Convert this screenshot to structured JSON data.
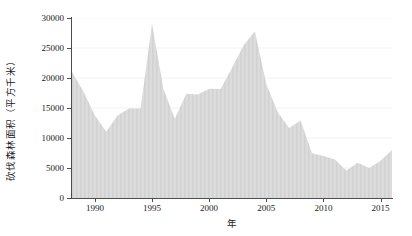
{
  "chart_data": {
    "type": "area",
    "title": "",
    "xlabel": "年",
    "ylabel": "砍伐森林面积（平方千米）",
    "xlim": [
      1988,
      2016
    ],
    "ylim": [
      0,
      30000
    ],
    "grid": true,
    "legend": null,
    "yticks": [
      0,
      5000,
      10000,
      15000,
      20000,
      25000,
      30000
    ],
    "ytick_labels": [
      "0",
      "5000",
      "10000",
      "15000",
      "20000",
      "25000",
      "30000"
    ],
    "xticks": [
      1990,
      1995,
      2000,
      2005,
      2010,
      2015
    ],
    "xtick_labels": [
      "1990",
      "1995",
      "2000",
      "2005",
      "2010",
      "2015"
    ],
    "x": [
      1988,
      1989,
      1990,
      1991,
      1992,
      1993,
      1994,
      1995,
      1996,
      1997,
      1998,
      1999,
      2000,
      2001,
      2002,
      2003,
      2004,
      2005,
      2006,
      2007,
      2008,
      2009,
      2010,
      2011,
      2012,
      2013,
      2014,
      2015,
      2016
    ],
    "values": [
      21050,
      17770,
      13730,
      11030,
      13786,
      14896,
      14896,
      29059,
      18161,
      13227,
      17383,
      17259,
      18226,
      18165,
      21651,
      25396,
      27772,
      19014,
      14286,
      11651,
      12911,
      7464,
      7000,
      6418,
      4571,
      5891,
      5012,
      6207,
      7989
    ],
    "series": [
      {
        "name": "砍伐森林面积",
        "fill_color": "#d9d9d9",
        "values": [
          21050,
          17770,
          13730,
          11030,
          13786,
          14896,
          14896,
          29059,
          18161,
          13227,
          17383,
          17259,
          18226,
          18165,
          21651,
          25396,
          27772,
          19014,
          14286,
          11651,
          12911,
          7464,
          7000,
          6418,
          4571,
          5891,
          5012,
          6207,
          7989
        ]
      }
    ],
    "colors": {
      "fill": "#d9d9d9",
      "stripe": "#cfcfcf",
      "grid": "#f2f2f2",
      "axis": "#4d4d4d",
      "background": "#ffffff"
    }
  }
}
